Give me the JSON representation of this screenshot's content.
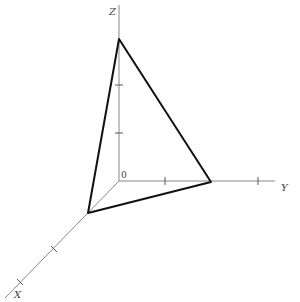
{
  "diagram": {
    "axes": {
      "x_label": "X",
      "y_label": "Y",
      "z_label": "Z",
      "origin_label": "0"
    },
    "triangle_vertices": [
      "X-intercept",
      "Y-intercept",
      "Z-intercept"
    ],
    "colors": {
      "axis": "#888888",
      "triangle": "#111111",
      "text": "#444444"
    }
  }
}
